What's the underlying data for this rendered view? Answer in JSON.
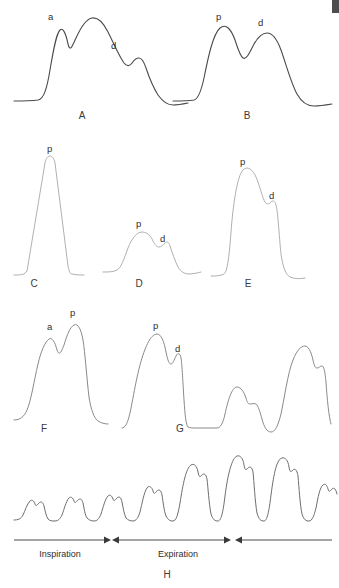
{
  "figure": {
    "background_color": "#ffffff",
    "stroke_colors": {
      "dark": "#4a4a4a",
      "mid": "#8a8a8a",
      "light": "#b0b0b0",
      "axis": "#3a3a3a"
    }
  },
  "panels": [
    {
      "id": "A",
      "label": "A",
      "label_x": 82,
      "label_y": 119,
      "description": "Biphasic waveform with a-wave shoulder and d notch on downslope",
      "stroke_class": "wave-dark",
      "path": "M14,101 C24,101 30,101 38,100 C44,99 47,88 50,70 C53,52 56,34 60,30 C63,27 66,34 68,44 C70,52 72,47 76,38 C81,27 86,19 92,18 C98,17 103,22 108,32 C114,44 119,56 124,63 C127,67 130,66 132,63 C134,60 136,58 139,58 C142,58 144,62 146,68 C149,77 153,87 158,95 C163,102 168,105 173,105 C178,105 183,104 188,103",
      "annotations": [
        {
          "text": "a",
          "x": 48,
          "y": 20
        },
        {
          "text": "d",
          "x": 111,
          "y": 49
        }
      ]
    },
    {
      "id": "B",
      "label": "B",
      "label_x": 247,
      "label_y": 119,
      "description": "Two rounded peaks p and d separated by a dip",
      "stroke_class": "wave-dark",
      "path": "M173,101 C182,101 188,101 194,100 C198,99 201,92 204,78 C208,58 213,34 220,28 C226,23 231,29 235,40 C238,49 240,56 243,58 C246,60 249,54 253,46 C257,38 262,33 267,33 C272,33 277,39 281,50 C286,64 291,83 297,94 C302,103 308,106 314,106 C320,106 326,105 332,104",
      "annotations": [
        {
          "text": "p",
          "x": 216,
          "y": 20
        },
        {
          "text": "d",
          "x": 258,
          "y": 26
        }
      ]
    },
    {
      "id": "C",
      "label": "C",
      "label_x": 34,
      "label_y": 287,
      "description": "Tall narrow triangular peak",
      "stroke_class": "wave-light",
      "path": "M14,275 C18,275 21,275 24,274 L27,271 L45,163 C46,158 48,156 50,156 C52,156 54,158 55,163 L68,266 C69,271 70,274 72,274 C76,275 80,275 84,275",
      "annotations": [
        {
          "text": "p",
          "x": 47,
          "y": 152
        }
      ]
    },
    {
      "id": "D",
      "label": "D",
      "label_x": 139,
      "label_y": 287,
      "description": "Low rounded dome with small d shoulder",
      "stroke_class": "wave-light",
      "path": "M103,272 C109,272 113,272 117,270 C121,268 124,259 128,248 C132,238 137,232 142,232 C147,232 151,236 153,241 C155,245 157,247 159,247 C161,247 163,245 165,243 C167,241 169,242 170,246 C172,252 175,261 178,267 C181,272 185,274 189,274 C193,274 197,273 201,272",
      "annotations": [
        {
          "text": "p",
          "x": 136,
          "y": 227
        },
        {
          "text": "d",
          "x": 160,
          "y": 242
        }
      ]
    },
    {
      "id": "E",
      "label": "E",
      "label_x": 248,
      "label_y": 287,
      "description": "Tall rounded peak with step shoulder d on descent",
      "stroke_class": "wave-light",
      "path": "M211,276 C216,276 220,276 224,274 C227,272 229,260 231,232 C233,206 237,176 243,170 C248,165 254,170 258,182 C261,191 263,199 265,202 C267,205 269,204 271,202 C273,200 275,201 276,205 C278,212 279,235 281,254 C283,268 286,275 290,277 C295,279 300,279 305,278",
      "annotations": [
        {
          "text": "p",
          "x": 240,
          "y": 165
        },
        {
          "text": "d",
          "x": 269,
          "y": 199
        }
      ]
    },
    {
      "id": "F",
      "label": "F",
      "label_x": 44,
      "label_y": 432,
      "description": "Bifid waveform with a-wave then taller p-wave",
      "stroke_class": "wave-mid",
      "path": "M14,420 C20,420 24,417 27,410 C31,401 34,381 38,364 C41,351 45,342 49,339 C52,337 55,342 57,350 C59,356 61,353 64,345 C67,335 70,327 74,325 C78,323 81,329 83,340 C85,352 87,381 89,397 C91,410 94,418 98,421 C101,423 105,424 108,424",
      "annotations": [
        {
          "text": "a",
          "x": 47,
          "y": 330
        },
        {
          "text": "p",
          "x": 70,
          "y": 316
        }
      ]
    },
    {
      "id": "G",
      "label": "G",
      "label_x": 180,
      "label_y": 432,
      "description": "Pulsus alternans: large beat with p and d, small beat, large beat",
      "stroke_class": "wave-mid",
      "path": "M122,428 C125,428 127,424 129,417 C132,406 136,377 142,358 C147,342 152,334 157,334 C161,334 164,341 166,352 C168,361 169,364 171,364 C173,364 174,360 176,356 C178,352 180,353 181,358 C182,363 183,385 184,400 C185,415 186,425 188,427 C190,428 193,428 197,428 L217,428 C220,428 223,424 225,414 C228,400 232,387 237,387 C241,387 244,392 246,398 C247,402 248,404 250,404 C252,404 254,403 256,404 C258,405 260,412 262,419 C264,427 267,432 271,432 C275,432 278,426 281,414 C284,400 288,372 293,360 C297,350 301,346 305,346 C308,346 311,351 313,360 C314,365 315,368 317,368 C319,368 320,366 322,366 C324,366 325,372 326,382 C327,398 329,418 331,424",
      "annotations": [
        {
          "text": "p",
          "x": 153,
          "y": 329
        },
        {
          "text": "d",
          "x": 175,
          "y": 352
        }
      ]
    },
    {
      "id": "H",
      "label": "H",
      "label_x": 167,
      "label_y": 578,
      "description": "Pulsus paradoxus: beat amplitude varies with respiratory cycle",
      "stroke_class": "wave-h",
      "path": "M14,520 C18,520 21,519 23,515 C25,511 27,504 30,501 C32,499 34,501 35,504 C36,507 37,505 39,503 C41,501 43,502 44,506 C45,510 46,516 48,519 C50,521 52,521 55,521 C58,521 60,519 62,515 C64,510 66,501 69,498 C71,496 73,498 74,501 C75,504 76,502 78,500 C80,498 82,499 83,503 C84,508 85,515 87,518 C89,520 91,521 94,521 C97,521 99,519 101,514 C103,508 105,499 108,496 C110,494 112,496 113,499 C114,502 115,500 117,498 C119,496 121,497 122,502 C123,507 124,514 126,518 C128,520 130,521 133,521 C136,521 138,518 140,512 C142,504 144,492 147,488 C149,485 152,487 153,491 C154,495 155,493 157,491 C159,489 161,490 162,495 C163,501 164,511 166,516 C168,520 170,521 173,521 C176,521 178,515 180,503 C183,484 186,468 191,465 C194,463 197,466 198,472 C199,478 200,477 202,475 C204,473 206,474 207,479 C208,487 209,504 211,514 C213,520 215,521 218,521 C221,521 223,513 225,496 C228,473 232,458 237,456 C240,455 243,458 244,465 C245,471 246,470 248,468 C250,466 252,467 253,472 C254,481 255,502 257,513 C259,520 261,521 264,521 C267,521 269,512 271,495 C274,472 277,459 282,458 C285,457 288,460 289,467 C290,473 291,472 293,470 C295,468 297,470 298,476 C299,487 300,505 302,514 C304,520 306,521 309,521 C312,521 314,516 316,508 C318,497 320,487 323,485 C325,483 327,485 328,489 C329,493 330,491 332,489 C334,487 336,489 337,494",
      "annotations": []
    }
  ],
  "respiration": {
    "inspiration": {
      "label": "Inspiration",
      "label_x": 60,
      "label_y": 557,
      "line_x1": 14,
      "line_x2": 108,
      "line_y": 540,
      "arrow_direction": "right"
    },
    "expiration": {
      "label": "Expiration",
      "label_x": 178,
      "label_y": 557,
      "line_x1": 115,
      "line_x2": 228,
      "line_y": 540,
      "arrow_direction": "both"
    },
    "next_cycle": {
      "label": "",
      "line_x1": 238,
      "line_x2": 332,
      "line_y": 540,
      "arrow_direction": "left"
    }
  },
  "corner_artifact": {
    "present": true,
    "color": "#4d4d4d",
    "x": 332,
    "y": 0,
    "width": 7,
    "height": 13
  }
}
